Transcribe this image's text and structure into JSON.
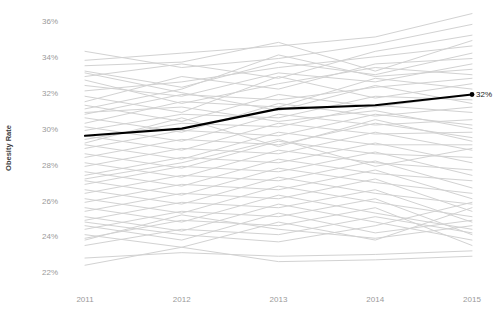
{
  "chart_data": {
    "type": "line",
    "title": "",
    "subtitle": "",
    "xlabel": "",
    "ylabel": "Obesity Rate",
    "x": [
      2011,
      2012,
      2013,
      2014,
      2015
    ],
    "xticklabels": [
      "2011",
      "2012",
      "2013",
      "2014",
      "2015"
    ],
    "yticklabels": [
      "36%",
      "34%",
      "32%",
      "30%",
      "28%",
      "26%",
      "24%",
      "22%"
    ],
    "ytickvalues": [
      36,
      34,
      32,
      30,
      28,
      26,
      24,
      22
    ],
    "ylim": [
      21.3,
      36.6
    ],
    "xlim": [
      2011,
      2015
    ],
    "grid": false,
    "legend": "none",
    "colors": {
      "background_series": "#d2d2d2",
      "highlight_series": "#000000",
      "tick_label": "#9a9a9a",
      "axis_title": "#3d3d3d",
      "background": "#ffffff"
    },
    "annotations": [
      {
        "text": "32%",
        "x": 2015,
        "y": 31.9,
        "series": "highlighted-state",
        "marker": "dot"
      }
    ],
    "highlight_series": {
      "name": "highlighted-state",
      "values": [
        29.6,
        30.0,
        31.1,
        31.3,
        31.9
      ],
      "end_label": "32%"
    },
    "series": [
      {
        "name": "series-01",
        "values": [
          33.8,
          34.2,
          34.6,
          35.1,
          36.4
        ]
      },
      {
        "name": "series-02",
        "values": [
          34.3,
          33.4,
          33.9,
          34.7,
          35.8
        ]
      },
      {
        "name": "series-03",
        "values": [
          32.9,
          33.6,
          32.8,
          34.3,
          35.2
        ]
      },
      {
        "name": "series-04",
        "values": [
          33.5,
          33.7,
          34.8,
          33.2,
          34.9
        ]
      },
      {
        "name": "series-05",
        "values": [
          32.1,
          32.6,
          33.4,
          34.0,
          34.6
        ]
      },
      {
        "name": "series-06",
        "values": [
          33.2,
          32.3,
          33.7,
          33.0,
          34.2
        ]
      },
      {
        "name": "series-07",
        "values": [
          31.5,
          32.9,
          32.2,
          33.6,
          33.9
        ]
      },
      {
        "name": "series-08",
        "values": [
          32.4,
          31.8,
          33.1,
          32.6,
          33.6
        ]
      },
      {
        "name": "series-09",
        "values": [
          31.1,
          32.2,
          34.1,
          32.9,
          33.3
        ]
      },
      {
        "name": "series-10",
        "values": [
          32.7,
          31.4,
          32.5,
          33.4,
          33.0
        ]
      },
      {
        "name": "series-11",
        "values": [
          30.8,
          31.9,
          31.6,
          32.3,
          32.8
        ]
      },
      {
        "name": "series-12",
        "values": [
          31.8,
          30.9,
          32.9,
          31.7,
          32.5
        ]
      },
      {
        "name": "series-13",
        "values": [
          30.3,
          31.5,
          31.2,
          32.8,
          32.2
        ]
      },
      {
        "name": "series-14",
        "values": [
          31.3,
          30.4,
          31.9,
          31.2,
          31.9
        ]
      },
      {
        "name": "series-15",
        "values": [
          29.9,
          30.8,
          30.6,
          31.8,
          31.6
        ]
      },
      {
        "name": "series-16",
        "values": [
          30.6,
          29.8,
          31.4,
          30.7,
          31.2
        ]
      },
      {
        "name": "series-17",
        "values": [
          29.4,
          30.3,
          30.1,
          31.3,
          30.9
        ]
      },
      {
        "name": "series-18",
        "values": [
          30.1,
          29.3,
          30.8,
          30.2,
          30.5
        ]
      },
      {
        "name": "series-19",
        "values": [
          28.9,
          29.9,
          29.6,
          30.8,
          30.2
        ]
      },
      {
        "name": "series-20",
        "values": [
          29.6,
          28.8,
          30.3,
          29.7,
          29.8
        ]
      },
      {
        "name": "series-21",
        "values": [
          28.4,
          29.4,
          29.1,
          30.3,
          29.5
        ]
      },
      {
        "name": "series-22",
        "values": [
          29.1,
          28.3,
          29.8,
          29.1,
          29.1
        ]
      },
      {
        "name": "series-23",
        "values": [
          27.9,
          28.9,
          28.6,
          29.8,
          28.8
        ]
      },
      {
        "name": "series-24",
        "values": [
          28.6,
          27.8,
          29.3,
          28.6,
          28.4
        ]
      },
      {
        "name": "series-25",
        "values": [
          27.4,
          28.4,
          28.1,
          29.2,
          28.1
        ]
      },
      {
        "name": "series-26",
        "values": [
          28.1,
          27.3,
          28.8,
          28.1,
          27.7
        ]
      },
      {
        "name": "series-27",
        "values": [
          26.9,
          27.9,
          27.6,
          28.7,
          27.4
        ]
      },
      {
        "name": "series-28",
        "values": [
          27.6,
          26.8,
          28.3,
          27.5,
          27.1
        ]
      },
      {
        "name": "series-29",
        "values": [
          26.4,
          27.4,
          27.1,
          28.2,
          26.7
        ]
      },
      {
        "name": "series-30",
        "values": [
          27.1,
          26.3,
          27.8,
          27.0,
          26.4
        ]
      },
      {
        "name": "series-31",
        "values": [
          25.9,
          26.9,
          26.6,
          27.7,
          26.1
        ]
      },
      {
        "name": "series-32",
        "values": [
          26.6,
          25.8,
          27.3,
          26.4,
          25.8
        ]
      },
      {
        "name": "series-33",
        "values": [
          25.4,
          26.4,
          26.1,
          27.2,
          25.4
        ]
      },
      {
        "name": "series-34",
        "values": [
          26.1,
          25.3,
          26.8,
          25.9,
          25.1
        ]
      },
      {
        "name": "series-35",
        "values": [
          24.9,
          25.9,
          25.6,
          26.6,
          24.8
        ]
      },
      {
        "name": "series-36",
        "values": [
          25.6,
          24.8,
          26.3,
          25.3,
          24.4
        ]
      },
      {
        "name": "series-37",
        "values": [
          24.4,
          25.4,
          25.1,
          26.1,
          24.1
        ]
      },
      {
        "name": "series-38",
        "values": [
          25.1,
          24.3,
          25.8,
          24.8,
          23.8
        ]
      },
      {
        "name": "series-39",
        "values": [
          23.9,
          24.9,
          24.6,
          25.6,
          23.5
        ]
      },
      {
        "name": "series-40",
        "values": [
          24.6,
          23.8,
          25.3,
          24.2,
          24.9
        ]
      },
      {
        "name": "series-41",
        "values": [
          23.5,
          24.4,
          24.1,
          25.1,
          24.2
        ]
      },
      {
        "name": "series-42",
        "values": [
          24.1,
          23.4,
          24.8,
          23.8,
          25.6
        ]
      },
      {
        "name": "series-43",
        "values": [
          24.8,
          24.1,
          23.7,
          24.6,
          25.9
        ]
      },
      {
        "name": "series-44",
        "values": [
          23.8,
          25.2,
          24.4,
          23.9,
          24.6
        ]
      },
      {
        "name": "series-45",
        "values": [
          22.8,
          23.1,
          22.9,
          23.0,
          23.2
        ]
      },
      {
        "name": "series-46",
        "values": [
          22.4,
          23.4,
          22.6,
          22.7,
          22.9
        ]
      },
      {
        "name": "series-47",
        "values": [
          30.9,
          31.2,
          30.4,
          31.0,
          30.0
        ]
      },
      {
        "name": "series-48",
        "values": [
          33.1,
          32.0,
          31.0,
          32.4,
          31.4
        ]
      },
      {
        "name": "series-49",
        "values": [
          29.2,
          30.6,
          29.0,
          30.5,
          29.3
        ]
      },
      {
        "name": "series-50",
        "values": [
          27.2,
          28.1,
          29.4,
          27.9,
          28.9
        ]
      }
    ]
  }
}
